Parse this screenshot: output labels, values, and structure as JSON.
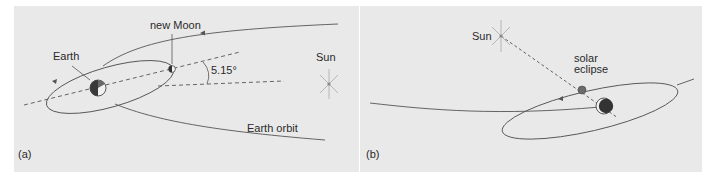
{
  "panel_a": {
    "label": "(a)",
    "earth_label": "Earth",
    "moon_label": "new Moon",
    "angle_label": "5.15°",
    "sun_label": "Sun",
    "orbit_label": "Earth orbit"
  },
  "panel_b": {
    "label": "(b)",
    "sun_label": "Sun",
    "eclipse_label_line1": "solar",
    "eclipse_label_line2": "eclipse"
  },
  "colors": {
    "background": "#e9e9e9",
    "line": "#555555",
    "sun_ray": "#b0b0b0",
    "sun_core": "#888888",
    "earth_dark": "#3a3a3a"
  }
}
